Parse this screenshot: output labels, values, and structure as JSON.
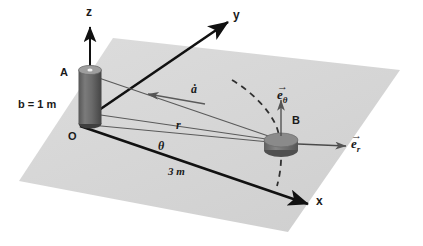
{
  "diagram": {
    "axes": {
      "z_label": "z",
      "y_label": "y",
      "x_label": "x"
    },
    "points": {
      "origin_label": "O",
      "post_top_label": "A",
      "puck_label": "B"
    },
    "dimensions": {
      "post_height_label": "b = 1 m",
      "x_distance_label": "3 m"
    },
    "measures": {
      "radial_label": "r",
      "angle_label": "θ",
      "cable_rate_label": "ȧ"
    },
    "unit_vectors": {
      "e_theta": {
        "arrow": "→",
        "base": "e",
        "sub": "θ"
      },
      "e_r": {
        "arrow": "→",
        "base": "e",
        "sub": "r"
      }
    },
    "colors": {
      "plane_fill": "#d6d6d6",
      "plane_fill_light": "#dedede",
      "axis_stroke": "#111111",
      "thin_stroke": "#555555",
      "cylinder_body": "#6f6f6f",
      "cylinder_dark": "#4a4a4a",
      "cylinder_top": "#9a9a9a",
      "puck_body": "#7a7a7a",
      "puck_top": "#8c8c8c",
      "background": "#ffffff",
      "text": "#1a1a1a"
    }
  }
}
